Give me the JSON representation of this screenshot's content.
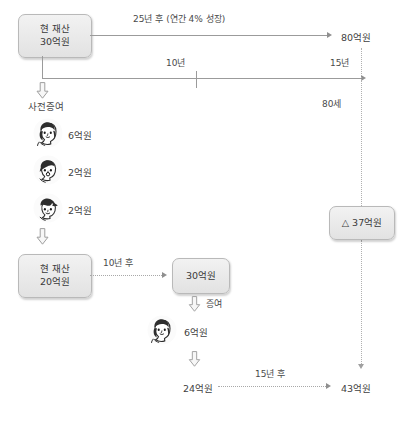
{
  "diagram": {
    "boxes": {
      "current_assets_top": {
        "line1": "현 재산",
        "line2": "30억원"
      },
      "current_assets_after_gift": {
        "line1": "현 재산",
        "line2": "20억원"
      },
      "grown_assets": {
        "line1": "30억원"
      },
      "difference": {
        "label": "△ 37억원"
      }
    },
    "top_path": {
      "caption": "25년 후 (연간 4% 성장)",
      "result": "80억원"
    },
    "timeline": {
      "first_segment": "10년",
      "second_segment": "15년",
      "age_marker": "80세"
    },
    "gift_section": {
      "heading": "사전증여",
      "recipients": [
        {
          "icon": "woman-avatar-icon",
          "amount": "6억원"
        },
        {
          "icon": "man-avatar-icon",
          "amount": "2억원"
        },
        {
          "icon": "child-avatar-icon",
          "amount": "2억원"
        }
      ]
    },
    "bottom_path": {
      "growth_caption": "10년 후",
      "gift_caption": "증여",
      "gift_recipient": {
        "icon": "woman-avatar-icon",
        "amount": "6억원"
      },
      "remaining": "24억원",
      "final_caption": "15년 후",
      "final_result": "43억원"
    },
    "colors": {
      "box_fill_top": "#f2f2f2",
      "box_fill_bottom": "#e2e2e2",
      "box_border": "#b9b9b9",
      "line": "#9b9b9b",
      "dotted_line": "#a8a8a8",
      "text": "#3b3b3b",
      "background": "#ffffff"
    }
  }
}
